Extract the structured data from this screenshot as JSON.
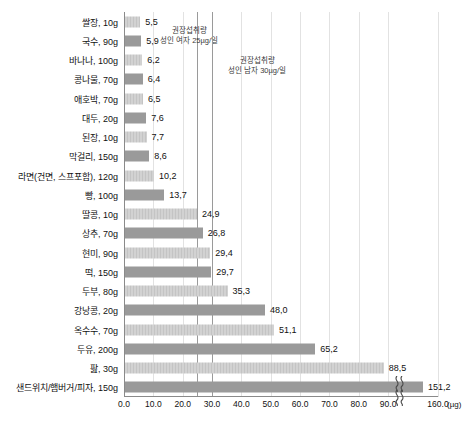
{
  "chart_data": {
    "type": "bar",
    "orientation": "horizontal",
    "title": "",
    "xlabel": "(µg)",
    "ylabel": "",
    "unit_label": "(µg)",
    "xlim": [
      0,
      160
    ],
    "grid": true,
    "legend": "none",
    "axis_break": {
      "present": true,
      "between": [
        95,
        140
      ]
    },
    "xticks": [
      "0.0",
      "10.0",
      "20.0",
      "30.0",
      "40.0",
      "50.0",
      "60.0",
      "70.0",
      "80.0",
      "90.0",
      "160.0"
    ],
    "xtick_values": [
      0,
      10,
      20,
      30,
      40,
      50,
      60,
      70,
      80,
      90,
      160
    ],
    "categories": [
      "쌀장, 10g",
      "국수, 90g",
      "바나나, 100g",
      "콩나물, 70g",
      "애호박, 70g",
      "대두, 20g",
      "된장, 10g",
      "막걸리, 150g",
      "라면(건면, 스프포함), 120g",
      "빵, 100g",
      "딸콩, 10g",
      "상추, 70g",
      "현미, 90g",
      "떡, 150g",
      "두부, 80g",
      "강낭콩, 20g",
      "옥수수, 70g",
      "두유, 200g",
      "팚, 30g",
      "샌드위치/햄버거/피자, 150g"
    ],
    "values": [
      5.5,
      5.9,
      6.2,
      6.4,
      6.5,
      7.6,
      7.7,
      8.6,
      10.2,
      13.7,
      24.9,
      26.8,
      29.4,
      29.7,
      35.3,
      48.0,
      51.1,
      65.2,
      88.5,
      151.2
    ],
    "value_labels": [
      "5,5",
      "5,9",
      "6,2",
      "6,4",
      "6,5",
      "7,6",
      "7,7",
      "8,6",
      "10,2",
      "13,7",
      "24,9",
      "26,8",
      "29,4",
      "29,7",
      "35,3",
      "48,0",
      "51,1",
      "65,2",
      "88,5",
      "151,2"
    ],
    "bar_styles": [
      "light",
      "dark",
      "light",
      "dark",
      "light",
      "dark",
      "light",
      "dark",
      "light",
      "dark",
      "light",
      "dark",
      "light",
      "dark",
      "light",
      "dark",
      "light",
      "dark",
      "light",
      "dark"
    ],
    "colors": {
      "bar_light": "#d2d2d2",
      "bar_dark": "#9a9a9a",
      "grid": "#e2e2e2",
      "axis": "#8a8a8a",
      "text": "#111111"
    },
    "reference_lines": [
      {
        "name": "female-adult-rni",
        "value": 25,
        "line1": "권장섭취량",
        "line2": "성인 여자 25µg/일"
      },
      {
        "name": "male-adult-rni",
        "value": 30,
        "line1": "권장섭취량",
        "line2": "성인 남자 30µg/일"
      }
    ]
  }
}
